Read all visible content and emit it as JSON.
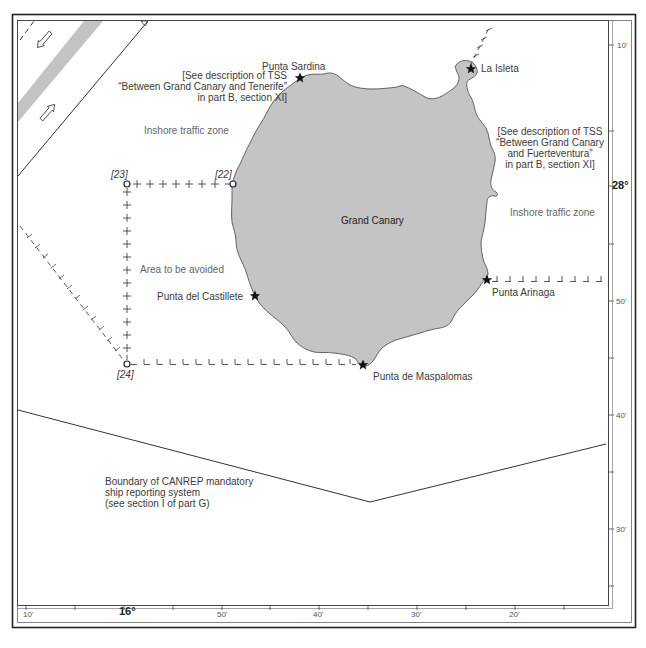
{
  "map": {
    "island_name": "Grand Canary",
    "colors": {
      "land_fill": "#c4c4c4",
      "coastline": "#555555",
      "lane_stripe": "#b8b8b8",
      "frame": "#222222",
      "text": "#3a3a3a"
    },
    "places": [
      {
        "name": "Punta Sardina",
        "symbol": "star"
      },
      {
        "name": "La Isleta",
        "symbol": "star"
      },
      {
        "name": "Punta del Castillete",
        "symbol": "star"
      },
      {
        "name": "Punta Arinaga",
        "symbol": "star"
      },
      {
        "name": "Punta de Maspalomas",
        "symbol": "star"
      }
    ],
    "waypoints": [
      {
        "id": "[22]"
      },
      {
        "id": "[23]"
      },
      {
        "id": "[24]"
      }
    ],
    "zones": {
      "inshore_west": "Inshore traffic zone",
      "inshore_east": "Inshore traffic zone",
      "area_avoided": "Area to be avoided"
    },
    "notes": {
      "tss_tenerife": [
        "[See description of TSS",
        "“Between Grand Canary  and Tenerife”",
        "in part B, section XI]"
      ],
      "tss_fuerteventura": [
        "[See description of TSS",
        "“Between Grand Canary",
        "and Fuerteventura”",
        "in part B, section XI]"
      ],
      "canrep": [
        "Boundary of CANREP mandatory",
        "ship reporting system",
        "(see section I of part G)"
      ]
    },
    "longitude_scale": [
      {
        "label": "10'",
        "major": false
      },
      {
        "label": "16°",
        "major": true
      },
      {
        "label": "50'",
        "major": false
      },
      {
        "label": "40'",
        "major": false
      },
      {
        "label": "30'",
        "major": false
      },
      {
        "label": "20'",
        "major": false
      }
    ],
    "latitude_scale": [
      {
        "label": "10'",
        "major": false
      },
      {
        "label": "28°",
        "major": true
      },
      {
        "label": "50'",
        "major": false
      },
      {
        "label": "40'",
        "major": false
      },
      {
        "label": "30'",
        "major": false
      }
    ]
  }
}
